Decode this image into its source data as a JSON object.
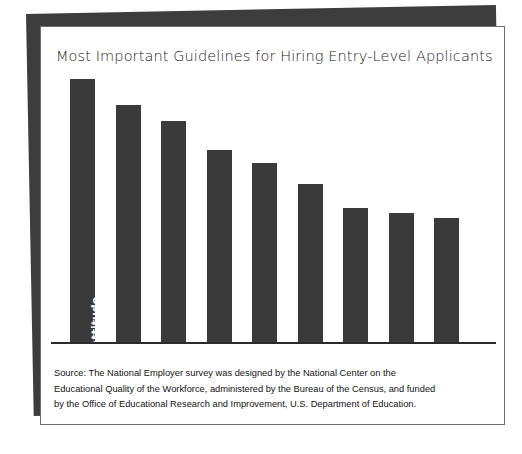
{
  "chart_data": {
    "type": "bar",
    "title": "Most Important Guidelines for Hiring Entry-Level Applicants",
    "xlabel": "",
    "ylabel": "",
    "grid": false,
    "legend": "none",
    "orientation": "vertical",
    "ylim": [
      0,
      100
    ],
    "categories": [
      "Attitude",
      "Communication skills",
      "Previous work experience",
      "Employer recommendations",
      "Industry-based credentials",
      "School completed",
      "Interview testing",
      "School grades",
      "School reputation"
    ],
    "values": [
      100,
      90,
      84,
      73,
      68,
      60,
      51,
      49,
      47
    ],
    "bar_color": "#3a3a3a",
    "label_color": "#ffffff"
  },
  "source": {
    "line1": "Source: The National Employer survey was designed by the National Center on the",
    "line2": "Educational Quality of the Workforce, administered by the Bureau of the Census, and funded",
    "line3": "by the Office of Educational Research and Improvement, U.S. Department of Education."
  }
}
